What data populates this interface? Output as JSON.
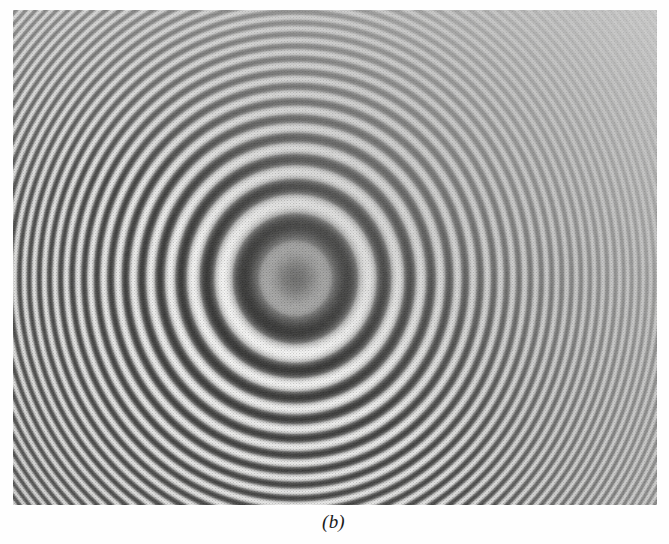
{
  "figure": {
    "caption": "(b)",
    "panel_label": "b",
    "kind": "photograph",
    "background_color": "#fefefe",
    "plate": {
      "x": 13,
      "y": 10,
      "width": 644,
      "height": 495,
      "paper_tone": "#f4f4f2",
      "ink_tone": "#1b1b1b",
      "texture": "halftone-dot",
      "illumination_falloff": "fringe contrast fades toward the upper-right corner"
    }
  },
  "chart_data": {
    "type": "heatmap",
    "title": "(b)",
    "subtitle": "",
    "xlabel": "",
    "ylabel": "",
    "grid": false,
    "legend": false,
    "axes_visible": false,
    "tick_labels": [],
    "annotations": [
      "(b)"
    ],
    "pattern": {
      "model": "airy-like concentric rings, radius_n proportional to sqrt(n)",
      "center_x_px": 282,
      "center_y_px": 268,
      "center_x_frac": 0.438,
      "center_y_frac": 0.541,
      "ellipticity_x": 1.0,
      "ellipticity_y": 1.04,
      "radial_scale_px": 72.5,
      "central_spot": {
        "present": true,
        "kind": "diffuse dark blob",
        "radius_px": 38,
        "peak_darkness": 0.62
      },
      "n_visible_rings": 27,
      "dark_ring_radii_px": [
        92,
        132,
        164,
        191,
        215,
        237,
        258,
        277,
        295,
        312,
        329,
        345,
        360,
        375,
        389,
        403,
        417,
        430,
        443,
        455,
        468,
        480,
        491,
        503,
        514,
        525,
        536
      ],
      "ring_spacing_px": {
        "inner": 40,
        "middle": 18,
        "outer": 12
      },
      "fringe_contrast": {
        "inner": 0.95,
        "middle": 0.85,
        "outer": 0.62,
        "upper_right_corner": 0.22
      },
      "ink_min": 0.02,
      "ink_max": 0.88
    }
  }
}
